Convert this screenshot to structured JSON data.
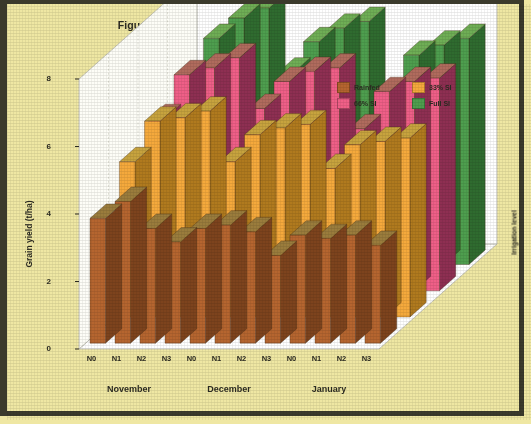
{
  "figure": {
    "title_line1": "Figure 13. Bread wheat response to levels of nitrogen(N),",
    "title_line2": "supplemental irrigation and sowing date at Tel Hadya",
    "background_color": "#efe7a3",
    "border_color": "#3b3a2c",
    "plot_background": "#ffffff"
  },
  "chart_data": {
    "type": "bar",
    "title": "Figure 13. Bread wheat response to levels of nitrogen(N), supplemental irrigation and sowing date at Tel Hadya",
    "subtitle": "",
    "xlabel": "",
    "ylabel": "Grain yield (t/ha)",
    "zlabel": "Irrigation level",
    "ylim": [
      0,
      8
    ],
    "yticks": [
      0,
      2,
      4,
      6,
      8
    ],
    "ytick_labels": [
      "0",
      "2",
      "4",
      "6",
      "8"
    ],
    "grid": false,
    "legend_position": "top-right",
    "projection": "3d",
    "categories": [
      "N0",
      "N1",
      "N2",
      "N3",
      "N0",
      "N1",
      "N2",
      "N3",
      "N0",
      "N1",
      "N2",
      "N3"
    ],
    "group_labels": [
      "November",
      "December",
      "January"
    ],
    "group_span": 4,
    "series": [
      {
        "name": "Rainfed",
        "color": "#b5652f",
        "side_color": "#7d431d",
        "top_color": "#9a7c3c",
        "values": [
          3.7,
          4.2,
          3.4,
          3.0,
          3.4,
          3.5,
          3.3,
          2.6,
          3.2,
          3.1,
          3.2,
          2.9
        ]
      },
      {
        "name": "33% SI",
        "color": "#f5a93c",
        "side_color": "#b07a1e",
        "top_color": "#c7a33e",
        "values": [
          4.6,
          5.8,
          5.9,
          6.1,
          4.6,
          5.4,
          5.6,
          5.7,
          4.4,
          5.1,
          5.2,
          5.3
        ]
      },
      {
        "name": "66% SI",
        "color": "#ef5f87",
        "side_color": "#8e2f52",
        "top_color": "#b06b5d",
        "values": [
          5.1,
          6.4,
          6.6,
          6.9,
          5.4,
          6.2,
          6.5,
          6.6,
          4.8,
          5.9,
          6.2,
          6.3
        ]
      },
      {
        "name": "Full SI",
        "color": "#4e9e4e",
        "side_color": "#2f6b2f",
        "top_color": "#6fae55",
        "values": [
          5.4,
          6.7,
          7.3,
          7.6,
          5.7,
          6.6,
          7.0,
          7.2,
          5.0,
          6.2,
          6.5,
          6.7
        ]
      }
    ]
  },
  "legend": {
    "items": [
      {
        "label": "Rainfed",
        "color": "#b5652f"
      },
      {
        "label": "33% SI",
        "color": "#f5a93c"
      },
      {
        "label": "66% SI",
        "color": "#ef5f87"
      },
      {
        "label": "Full SI",
        "color": "#4e9e4e"
      }
    ]
  },
  "axes": {
    "y_title": "Grain yield (t/ha)",
    "depth_title": "Irrigation level"
  }
}
